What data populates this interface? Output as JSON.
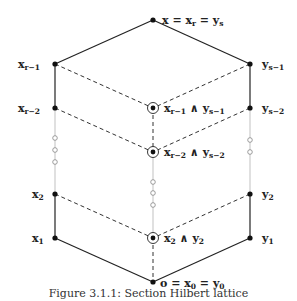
{
  "diagram": {
    "type": "lattice",
    "nodes": {
      "top": {
        "label": "x = x_r = y_s",
        "main": "x = x",
        "sub1": "r",
        "mid": " = y",
        "sub2": "s"
      },
      "left": [
        {
          "id": "x_r-1",
          "base": "x",
          "sub": "r−1"
        },
        {
          "id": "x_r-2",
          "base": "x",
          "sub": "r−2"
        },
        {
          "id": "x_2",
          "base": "x",
          "sub": "2"
        },
        {
          "id": "x_1",
          "base": "x",
          "sub": "1"
        }
      ],
      "right": [
        {
          "id": "y_s-1",
          "base": "y",
          "sub": "s−1"
        },
        {
          "id": "y_s-2",
          "base": "y",
          "sub": "s−2"
        },
        {
          "id": "y_2",
          "base": "y",
          "sub": "2"
        },
        {
          "id": "y_1",
          "base": "y",
          "sub": "1"
        }
      ],
      "center": [
        {
          "id": "meet_r-1_s-1",
          "a": "x",
          "asub": "r−1",
          "op": " ∧ ",
          "b": "y",
          "bsub": "s−1"
        },
        {
          "id": "meet_r-2_s-2",
          "a": "x",
          "asub": "r−2",
          "op": " ∧ ",
          "b": "y",
          "bsub": "s−2"
        },
        {
          "id": "meet_2_2",
          "a": "x",
          "asub": "2",
          "op": " ∧ ",
          "b": "y",
          "bsub": "2"
        }
      ],
      "bottom": {
        "label": "o = x_0 = y_0",
        "main": "o = x",
        "sub1": "0",
        "mid": " = y",
        "sub2": "0"
      }
    },
    "edges": {
      "solid": [
        [
          "x_1",
          "o"
        ],
        [
          "y_1",
          "o"
        ],
        [
          "x_r-1",
          "top"
        ],
        [
          "y_s-1",
          "top"
        ],
        [
          "x_2",
          "x_1"
        ],
        [
          "x_r-1",
          "x_r-2"
        ],
        [
          "y_2",
          "y_1"
        ],
        [
          "y_s-1",
          "y_s-2"
        ]
      ],
      "dashed": [
        [
          "x_r-1",
          "meet_r-1_s-1"
        ],
        [
          "y_s-1",
          "meet_r-1_s-1"
        ],
        [
          "x_r-2",
          "meet_r-2_s-2"
        ],
        [
          "y_s-2",
          "meet_r-2_s-2"
        ],
        [
          "x_2",
          "meet_2_2"
        ],
        [
          "y_2",
          "meet_2_2"
        ],
        [
          "meet_r-1_s-1",
          "meet_r-2_s-2"
        ],
        [
          "meet_2_2",
          "o"
        ]
      ],
      "ellipsis": [
        "x_r-2 .. x_2",
        "y_s-2 .. y_2",
        "meet_r-2_s-2 .. meet_2_2"
      ]
    }
  },
  "caption": "Figure 3.1.1: Section Hilbert lattice"
}
